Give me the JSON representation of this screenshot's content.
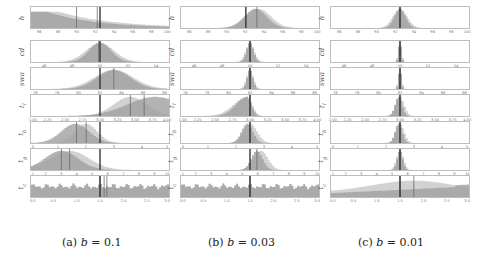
{
  "figure": {
    "captions": [
      "(a) b = 0.1",
      "(b) b = 0.03",
      "(c) b = 0.01"
    ],
    "caption_parts": [
      {
        "label": "(a)",
        "var": "b",
        "eq": "= 0.1"
      },
      {
        "label": "(b)",
        "var": "b",
        "eq": "= 0.03"
      },
      {
        "label": "(c)",
        "var": "b",
        "eq": "= 0.01"
      }
    ]
  },
  "chart_data": {
    "type": "histogram-grid",
    "columns": [
      "b = 0.1",
      "b = 0.03",
      "b = 0.01"
    ],
    "rows": [
      {
        "ylabel": "h",
        "ticks": [
          "86",
          "88",
          "90",
          "92",
          "94",
          "96",
          "98",
          "100"
        ],
        "range": [
          85,
          100
        ],
        "true_value": 92.2
      },
      {
        "ylabel": "cd",
        "ticks": [
          "46",
          "48",
          "50",
          "52",
          "54"
        ],
        "range": [
          45,
          55
        ],
        "true_value": 50
      },
      {
        "ylabel": "swa",
        "ticks": [
          "76",
          "78",
          "80",
          "82",
          "84",
          "86",
          "88"
        ],
        "range": [
          75.5,
          88.5
        ],
        "true_value": 82
      },
      {
        "ylabel": "t_l",
        "ticks": [
          "2.00",
          "2.25",
          "2.50",
          "2.75",
          "3.00",
          "3.25",
          "3.50",
          "3.75",
          "4.00"
        ],
        "range": [
          2.0,
          4.0
        ],
        "true_value": 3.0
      },
      {
        "ylabel": "t_b",
        "ticks": [
          "0",
          "1",
          "2",
          "3",
          "4",
          "5"
        ],
        "range": [
          0,
          5
        ],
        "true_value": 2.5
      },
      {
        "ylabel": "t_g",
        "ticks": [
          "1",
          "2",
          "3",
          "4",
          "5",
          "6",
          "7",
          "8",
          "9",
          "10"
        ],
        "range": [
          1,
          10
        ],
        "true_value": 5.5
      },
      {
        "ylabel": "t_c",
        "ticks": [
          "0.0",
          "0.5",
          "1.0",
          "1.5",
          "2.0",
          "2.5",
          "3.0"
        ],
        "range": [
          0,
          3.0
        ],
        "true_value": 1.5
      }
    ],
    "series": [
      {
        "name": "posterior (dark)",
        "color": "#9e9e9e"
      },
      {
        "name": "posterior (light)",
        "color": "#cfcfcf"
      }
    ],
    "annotations": "Vertical dark line marks true parameter value; thinner lines mark posterior means. Distributions narrow as b decreases."
  },
  "colors": {
    "hist_dark": "#a0a0a0",
    "hist_light": "#d2d2d2",
    "true_line": "#333333",
    "mean_line": "#666666",
    "frame": "#bdbdbd"
  }
}
